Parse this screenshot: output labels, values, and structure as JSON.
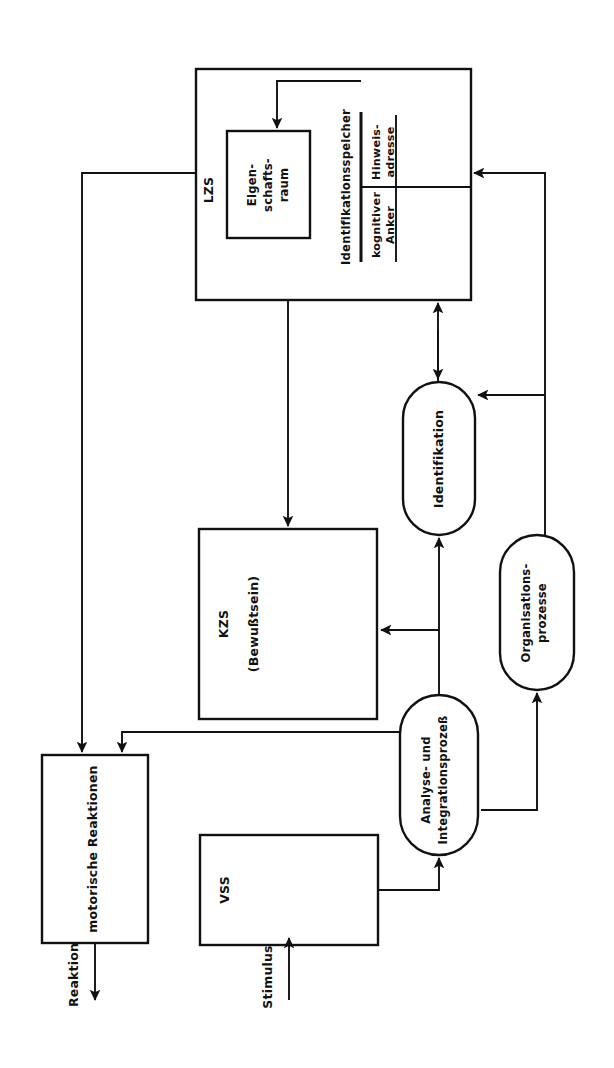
{
  "diagram": {
    "orientation": "rotated-90-ccw",
    "background_color": "#ffffff",
    "line_color": "#111111",
    "nodes": {
      "lzs": {
        "label": "LZS",
        "shape": "rect"
      },
      "eigenschaftsraum": {
        "line1": "Eigen-",
        "line2": "schafts-",
        "line3": "raum",
        "shape": "rect"
      },
      "identifikationsspeicher": {
        "label": "Identifikationsspeicher",
        "shape": "label"
      },
      "hinweisadresse": {
        "line1": "Hinweis-",
        "line2": "adresse",
        "shape": "label"
      },
      "kognitiver_anker": {
        "line1": "kognitiver",
        "line2": "Anker",
        "shape": "label"
      },
      "identifikation": {
        "label": "Identifikation",
        "shape": "capsule"
      },
      "organisationsprozesse": {
        "line1": "Organisations-",
        "line2": "prozesse",
        "shape": "capsule"
      },
      "kzs": {
        "label": "KZS",
        "sublabel": "(Bewußtsein)",
        "shape": "rect"
      },
      "analyse": {
        "line1": "Analyse- und",
        "line2": "Integrationsprozeß",
        "shape": "capsule"
      },
      "motorische": {
        "label": "motorische Reaktionen",
        "shape": "rect"
      },
      "vss": {
        "label": "VSS",
        "shape": "rect"
      },
      "reaktion": {
        "label": "Reaktion",
        "shape": "edge-label"
      },
      "stimulus": {
        "label": "Stimulus",
        "shape": "edge-label"
      }
    },
    "edges": [
      {
        "from": "identifikationsspeicher",
        "to": "eigenschaftsraum"
      },
      {
        "from": "lzs",
        "to": "motorische"
      },
      {
        "from": "lzs",
        "to": "kzs"
      },
      {
        "from": "identifikation",
        "to": "lzs"
      },
      {
        "from": "organisationsprozesse",
        "to": "lzs"
      },
      {
        "from": "analyse",
        "to": "identifikation"
      },
      {
        "from": "analyse",
        "to": "kzs"
      },
      {
        "from": "analyse",
        "to": "motorische"
      },
      {
        "from": "analyse",
        "to": "organisationsprozesse"
      },
      {
        "from": "organisationsprozesse",
        "to": "identifikation"
      },
      {
        "from": "vss",
        "to": "analyse"
      },
      {
        "from": "stimulus",
        "to": "vss"
      },
      {
        "from": "motorische",
        "to": "reaktion"
      }
    ]
  }
}
